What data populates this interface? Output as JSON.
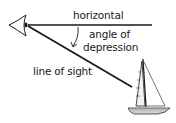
{
  "diagram": {
    "labels": {
      "horizontal": "horizontal",
      "angle_line1": "angle of",
      "angle_line2": "depression",
      "line_of_sight": "line of sight"
    },
    "colors": {
      "line": "#1a1a1a",
      "text": "#1a1a1a",
      "background": "#ffffff"
    },
    "elements": [
      "eye",
      "horizontal-line",
      "line-of-sight",
      "angle-arc",
      "sailboat"
    ]
  }
}
